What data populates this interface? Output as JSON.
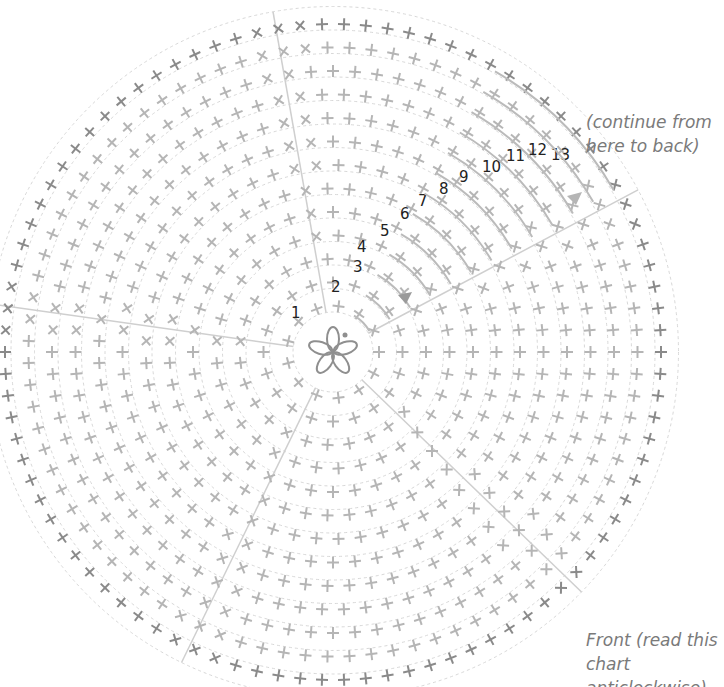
{
  "diagram": {
    "type": "crochet-round-chart",
    "side_label_line1": "Front (read this chart",
    "side_label_line2": "anticlockwise)",
    "continue_note_line1": "(continue from",
    "continue_note_line2": "here to back)",
    "center": "magic-ring-5-chain",
    "rounds": [
      "1",
      "2",
      "3",
      "4",
      "5",
      "6",
      "7",
      "8",
      "9",
      "10",
      "11",
      "12",
      "13"
    ],
    "stitch_symbols": {
      "plus": "double-crochet",
      "x": "double-crochet-through-back",
      "v": "increase"
    },
    "colors": {
      "stitch": "#b5b5b5",
      "outer_stitch": "#8a8a8a",
      "guide": "#d8d8d8",
      "text": "#222222",
      "note": "#7a7a7a"
    }
  }
}
